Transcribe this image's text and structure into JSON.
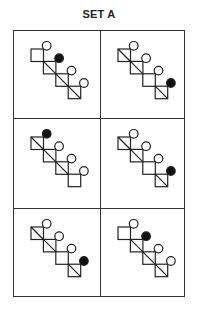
{
  "title": "SET A",
  "colors": {
    "stroke": "#222222",
    "filled": "#111111",
    "open": "#ffffff",
    "border": "#333333"
  },
  "figure_spec": {
    "square_size": 12.5,
    "circle_radius": 4.3,
    "step": 12.4,
    "description": "Four squares in a descending diagonal staircase; each square has a circle at its top-right corner. Some squares contain a diagonal line (top-left to bottom-right); one circle per figure is filled."
  },
  "panels": [
    {
      "id": 1,
      "row": 0,
      "col": 0,
      "squares": [
        {
          "diagonal": false,
          "circle": "open"
        },
        {
          "diagonal": true,
          "circle": "filled"
        },
        {
          "diagonal": true,
          "circle": "open"
        },
        {
          "diagonal": true,
          "circle": "open"
        }
      ]
    },
    {
      "id": 2,
      "row": 0,
      "col": 1,
      "squares": [
        {
          "diagonal": true,
          "circle": "open"
        },
        {
          "diagonal": true,
          "circle": "open"
        },
        {
          "diagonal": false,
          "circle": "open"
        },
        {
          "diagonal": true,
          "circle": "filled"
        }
      ]
    },
    {
      "id": 3,
      "row": 1,
      "col": 0,
      "squares": [
        {
          "diagonal": true,
          "circle": "filled"
        },
        {
          "diagonal": true,
          "circle": "open"
        },
        {
          "diagonal": true,
          "circle": "open"
        },
        {
          "diagonal": false,
          "circle": "open"
        }
      ]
    },
    {
      "id": 4,
      "row": 1,
      "col": 1,
      "squares": [
        {
          "diagonal": true,
          "circle": "open"
        },
        {
          "diagonal": true,
          "circle": "open"
        },
        {
          "diagonal": false,
          "circle": "open"
        },
        {
          "diagonal": true,
          "circle": "filled"
        }
      ]
    },
    {
      "id": 5,
      "row": 2,
      "col": 0,
      "squares": [
        {
          "diagonal": true,
          "circle": "open"
        },
        {
          "diagonal": true,
          "circle": "open"
        },
        {
          "diagonal": false,
          "circle": "open"
        },
        {
          "diagonal": true,
          "circle": "filled"
        }
      ]
    },
    {
      "id": 6,
      "row": 2,
      "col": 1,
      "squares": [
        {
          "diagonal": false,
          "circle": "open"
        },
        {
          "diagonal": true,
          "circle": "filled"
        },
        {
          "diagonal": true,
          "circle": "open"
        },
        {
          "diagonal": true,
          "circle": "open"
        }
      ]
    }
  ]
}
